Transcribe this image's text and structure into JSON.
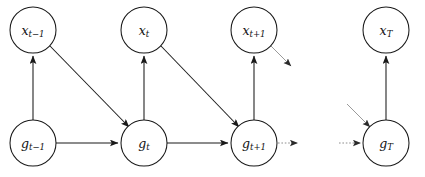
{
  "figure": {
    "type": "probabilistic-graphical-model",
    "background_color": "#ffffff",
    "stroke_color": "#1a1a1a",
    "faint_stroke_color": "#9a9a9a",
    "width": 425,
    "height": 177
  },
  "nodes": [
    {
      "id": "x_tm1",
      "base": "x",
      "sub": "t−1",
      "row": "top",
      "cx": 33,
      "cy": 30,
      "r": 23
    },
    {
      "id": "x_t",
      "base": "x",
      "sub": "t",
      "row": "top",
      "cx": 144,
      "cy": 30,
      "r": 23
    },
    {
      "id": "x_tp1",
      "base": "x",
      "sub": "t+1",
      "row": "top",
      "cx": 254,
      "cy": 30,
      "r": 23
    },
    {
      "id": "x_T",
      "base": "x",
      "sub": "T",
      "row": "top",
      "cx": 386,
      "cy": 30,
      "r": 23
    },
    {
      "id": "g_tm1",
      "base": "g",
      "sub": "t−1",
      "row": "bottom",
      "cx": 33,
      "cy": 143,
      "r": 23
    },
    {
      "id": "g_t",
      "base": "g",
      "sub": "t",
      "row": "bottom",
      "cx": 144,
      "cy": 143,
      "r": 23
    },
    {
      "id": "g_tp1",
      "base": "g",
      "sub": "t+1",
      "row": "bottom",
      "cx": 254,
      "cy": 143,
      "r": 23
    },
    {
      "id": "g_T",
      "base": "g",
      "sub": "T",
      "row": "bottom",
      "cx": 386,
      "cy": 143,
      "r": 23
    }
  ],
  "edges": [
    {
      "id": "e-gtm1-xtm1",
      "from": "g_tm1",
      "to": "x_tm1",
      "kind": "vertical",
      "style": "solid"
    },
    {
      "id": "e-gt-xt",
      "from": "g_t",
      "to": "x_t",
      "kind": "vertical",
      "style": "solid"
    },
    {
      "id": "e-gtp1-xtp1",
      "from": "g_tp1",
      "to": "x_tp1",
      "kind": "vertical",
      "style": "solid"
    },
    {
      "id": "e-gT-xT",
      "from": "g_T",
      "to": "x_T",
      "kind": "vertical",
      "style": "solid"
    },
    {
      "id": "e-gtm1-gt",
      "from": "g_tm1",
      "to": "g_t",
      "kind": "horizontal",
      "style": "solid"
    },
    {
      "id": "e-gt-gtp1",
      "from": "g_t",
      "to": "g_tp1",
      "kind": "horizontal",
      "style": "solid"
    },
    {
      "id": "e-xtm1-gt",
      "from": "x_tm1",
      "to": "g_t",
      "kind": "diagonal",
      "style": "solid"
    },
    {
      "id": "e-xt-gtp1",
      "from": "x_t",
      "to": "g_tp1",
      "kind": "diagonal",
      "style": "solid"
    }
  ],
  "continuation_edges": [
    {
      "id": "c-xtp1-out",
      "kind": "diagonal",
      "style": "faint",
      "note": "outgoing from x_t+1 toward omitted g_t+2"
    },
    {
      "id": "c-gtp1-out",
      "kind": "horizontal",
      "style": "dotted",
      "note": "outgoing from g_t+1 toward omitted g_t+2"
    },
    {
      "id": "c-gT-in-diag",
      "kind": "diagonal",
      "style": "faint",
      "note": "incoming to g_T from omitted x_T-1"
    },
    {
      "id": "c-gT-in-horz",
      "kind": "horizontal",
      "style": "dotted",
      "note": "incoming to g_T from omitted g_T-1"
    }
  ]
}
